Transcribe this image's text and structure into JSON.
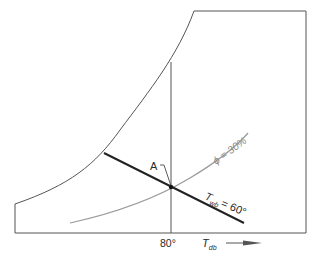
{
  "diagram": {
    "type": "psychrometric-chart-sketch",
    "point_label": "A",
    "tdb_value_label": "80°",
    "tdb_axis_symbol": "T",
    "tdb_axis_subscript": "db",
    "twb_symbol": "T",
    "twb_subscript": "wb",
    "twb_value": "= 60°",
    "phi_label": "ϕ = 30%",
    "colors": {
      "outline": "#555555",
      "wet_bulb_line": "#222222",
      "rh_curve": "#9a9a9a",
      "dry_bulb_line": "#555555"
    }
  }
}
